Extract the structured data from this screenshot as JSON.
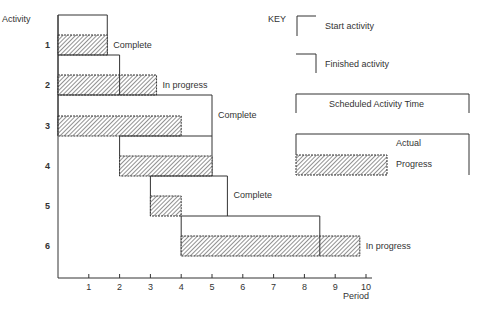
{
  "chart_data": {
    "type": "gantt",
    "title": "",
    "ylabel": "Activity",
    "xlabel": "Period",
    "xlim": [
      0,
      10
    ],
    "x_ticks": [
      "1",
      "2",
      "3",
      "4",
      "5",
      "6",
      "7",
      "8",
      "9",
      "10"
    ],
    "activities": [
      {
        "id": "1",
        "scheduled_start": 0,
        "scheduled_end": 1.6,
        "actual_start": 0,
        "actual_end": 1.6,
        "status": "Complete"
      },
      {
        "id": "2",
        "scheduled_start": 0,
        "scheduled_end": 2.0,
        "actual_start": 0,
        "actual_end": 3.2,
        "status": "In progress"
      },
      {
        "id": "3",
        "scheduled_start": 0,
        "scheduled_end": 5.0,
        "actual_start": 0,
        "actual_end": 4.0,
        "status": "Complete"
      },
      {
        "id": "4",
        "scheduled_start": 2.0,
        "scheduled_end": 5.0,
        "actual_start": 2.0,
        "actual_end": 5.0,
        "status": ""
      },
      {
        "id": "5",
        "scheduled_start": 3.0,
        "scheduled_end": 5.5,
        "actual_start": 3.0,
        "actual_end": 4.0,
        "status": "Complete"
      },
      {
        "id": "6",
        "scheduled_start": 4.0,
        "scheduled_end": 8.5,
        "actual_start": 4.0,
        "actual_end": 9.8,
        "status": "In progress"
      }
    ],
    "grid": false,
    "legend_position": "top-right"
  },
  "key": {
    "title": "KEY",
    "start_activity": "Start activity",
    "finished_activity": "Finished activity",
    "scheduled_activity_time": "Scheduled Activity Time",
    "actual": "Actual",
    "progress": "Progress"
  },
  "colors": {
    "line": "#333333",
    "hatch": "#555555",
    "background": "#ffffff"
  }
}
